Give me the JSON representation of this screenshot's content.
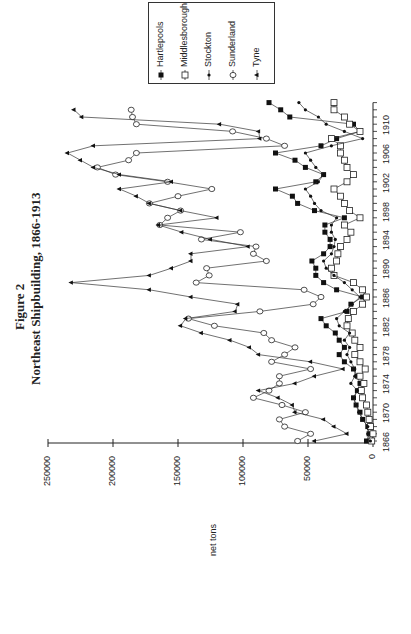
{
  "figure": {
    "label": "Figure 2",
    "title": "Northeast Shipbuilding, 1866-1913",
    "ylabel": "net tons"
  },
  "axis": {
    "value_ticks": [
      "0",
      "50000",
      "100000",
      "150000",
      "200000",
      "250000"
    ],
    "year_ticks": [
      "1866",
      "1870",
      "1874",
      "1878",
      "1882",
      "1886",
      "1890",
      "1894",
      "1898",
      "1902",
      "1906",
      "1910"
    ]
  },
  "legend": {
    "items": [
      {
        "label": "Hartlepools",
        "marker": "filled-square"
      },
      {
        "label": "Middlesborough",
        "marker": "open-square"
      },
      {
        "label": "Stockton",
        "marker": "small-diamond"
      },
      {
        "label": "Sunderland",
        "marker": "open-diamond"
      },
      {
        "label": "Tyne",
        "marker": "filled-triangle"
      }
    ]
  },
  "chart_data": {
    "type": "line",
    "xlabel": "",
    "ylabel": "net tons",
    "ylim": [
      0,
      250000
    ],
    "xlim": [
      1866,
      1913
    ],
    "orientation": "rotated 90° counter-clockwise (years run bottom-to-top, values run right-to-left)",
    "legend_position": "top-right (rotated)",
    "grid": false,
    "x": [
      1866,
      1867,
      1868,
      1869,
      1870,
      1871,
      1872,
      1873,
      1874,
      1875,
      1876,
      1877,
      1878,
      1879,
      1880,
      1881,
      1882,
      1883,
      1884,
      1885,
      1886,
      1887,
      1888,
      1889,
      1890,
      1891,
      1892,
      1893,
      1894,
      1895,
      1896,
      1897,
      1898,
      1899,
      1900,
      1901,
      1902,
      1903,
      1904,
      1905,
      1906,
      1907,
      1908,
      1909,
      1910,
      1911,
      1912,
      1913
    ],
    "series": [
      {
        "name": "Hartlepools",
        "values": [
          5000,
          3000,
          4000,
          8000,
          10000,
          13000,
          15000,
          12000,
          10000,
          12000,
          15000,
          22000,
          26000,
          22000,
          26000,
          29000,
          36000,
          40000,
          20000,
          17000,
          8000,
          28000,
          38000,
          44000,
          44000,
          47000,
          38000,
          33000,
          33000,
          37000,
          37000,
          22000,
          45000,
          58000,
          62000,
          75000,
          44000,
          38000,
          52000,
          60000,
          75000,
          40000,
          28000,
          10000,
          15000,
          64000,
          71000,
          80000
        ]
      },
      {
        "name": "Middlesborough",
        "values": [
          1000,
          0,
          2000,
          3000,
          4000,
          5000,
          8000,
          9000,
          7000,
          10000,
          6000,
          10000,
          14000,
          10000,
          14000,
          16000,
          20000,
          19000,
          15000,
          8000,
          5000,
          8000,
          15000,
          30000,
          32000,
          28000,
          27000,
          25000,
          20000,
          17000,
          22000,
          10000,
          18000,
          22000,
          25000,
          30000,
          20000,
          15000,
          20000,
          22000,
          25000,
          25000,
          32000,
          10000,
          18000,
          22000,
          30000,
          30000
        ]
      },
      {
        "name": "Stockton",
        "values": [
          2000,
          4000,
          4000,
          8000,
          11000,
          13000,
          15000,
          12000,
          17000,
          14000,
          14000,
          17000,
          20000,
          18000,
          22000,
          18000,
          26000,
          28000,
          22000,
          16000,
          10000,
          16000,
          22000,
          30000,
          36000,
          38000,
          32000,
          30000,
          29000,
          32000,
          32000,
          28000,
          40000,
          45000,
          48000,
          52000,
          42000,
          38000,
          44000,
          48000,
          52000,
          32000,
          8000,
          22000,
          36000,
          42000,
          52000,
          57000
        ]
      },
      {
        "name": "Sunderland",
        "values": [
          58000,
          48000,
          68000,
          72000,
          52000,
          70000,
          92000,
          80000,
          72000,
          72000,
          48000,
          78000,
          68000,
          60000,
          78000,
          84000,
          122000,
          142000,
          87000,
          46000,
          40000,
          53000,
          136000,
          126000,
          128000,
          82000,
          92000,
          90000,
          132000,
          102000,
          164000,
          158000,
          148000,
          172000,
          150000,
          124000,
          158000,
          198000,
          212000,
          188000,
          182000,
          68000,
          82000,
          108000,
          182000,
          185000,
          186000,
          0
        ]
      },
      {
        "name": "Tyne",
        "values": [
          45000,
          20000,
          30000,
          38000,
          60000,
          62000,
          73000,
          88000,
          60000,
          45000,
          23000,
          48000,
          88000,
          95000,
          110000,
          132000,
          148000,
          144000,
          106000,
          104000,
          140000,
          172000,
          232000,
          172000,
          155000,
          140000,
          140000,
          96000,
          125000,
          147000,
          165000,
          120000,
          148000,
          172000,
          182000,
          195000,
          155000,
          195000,
          215000,
          225000,
          235000,
          215000,
          87000,
          88000,
          118000,
          224000,
          230000,
          0
        ]
      }
    ]
  }
}
